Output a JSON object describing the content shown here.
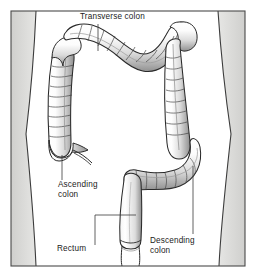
{
  "figure": {
    "frame": {
      "border_color": "#4a4a4a",
      "background_color": "#ffffff",
      "x": 11,
      "y": 11,
      "width": 234,
      "height": 255
    },
    "body_silhouette": {
      "name": "torso-outline",
      "outline_color": "#3c3c3c",
      "shade_color": "#d8d8d6"
    },
    "organ": {
      "name": "large-intestine",
      "fill_color": "#fbfbfb",
      "outline_color": "#2a2a2a",
      "shadow_color": "#9a9a9a"
    }
  },
  "labels": [
    {
      "id": "transverse-colon",
      "text": "Transverse colon",
      "lines": [
        "Transverse colon"
      ],
      "text_x": 80,
      "text_y": 19,
      "leader": {
        "type": "vertical",
        "x": 98,
        "y1": 24,
        "y2": 51
      }
    },
    {
      "id": "ascending-colon",
      "text": "Ascending colon",
      "lines": [
        "Ascending",
        "colon"
      ],
      "text_x": 58,
      "text_y": 187,
      "leader": {
        "type": "vertical",
        "x": 62,
        "y1": 155,
        "y2": 180
      }
    },
    {
      "id": "descending-colon",
      "text": "Descending colon",
      "lines": [
        "Descending",
        "colon"
      ],
      "text_x": 150,
      "text_y": 243,
      "leader": {
        "type": "vertical",
        "x": 193,
        "y1": 166,
        "y2": 234
      }
    },
    {
      "id": "rectum",
      "text": "Rectum",
      "lines": [
        "Rectum"
      ],
      "text_x": 57,
      "text_y": 251,
      "leader": {
        "type": "elbow",
        "x1": 95,
        "y1": 245,
        "x2": 95,
        "y2": 215,
        "x3": 136,
        "y3": 215
      }
    }
  ],
  "colors": {
    "label_text": "#1b1b1b",
    "leader_line": "#3a3a3a",
    "frame_border": "#4a4a4a",
    "torso_shade": "#d8d8d6",
    "colon_fill": "#fbfbfb",
    "colon_outline": "#2a2a2a"
  }
}
